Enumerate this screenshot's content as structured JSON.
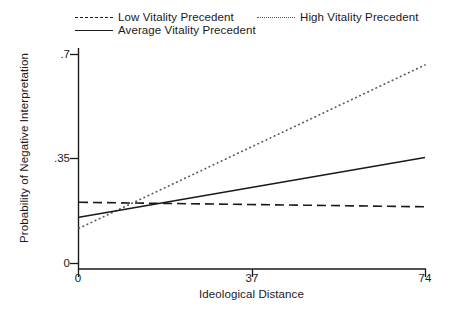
{
  "chart_data": {
    "type": "line",
    "title": "",
    "xlabel": "Ideological Distance",
    "ylabel": "Probability of Negative Interpretation",
    "xlim": [
      0,
      74
    ],
    "ylim": [
      0,
      0.7
    ],
    "xticks": [
      "0",
      "37",
      "74"
    ],
    "xtick_values": [
      0,
      37,
      74
    ],
    "yticks": [
      ".7",
      ".35",
      "0"
    ],
    "ytick_values": [
      0.7,
      0.35,
      0
    ],
    "grid": false,
    "legend_position": "top",
    "series": [
      {
        "name": "Low Vitality Precedent",
        "style": "dashed",
        "color": "#1a1a1a",
        "x": [
          0,
          74
        ],
        "values": [
          0.205,
          0.19
        ]
      },
      {
        "name": "Average Vitality Precedent",
        "style": "solid",
        "color": "#1a1a1a",
        "x": [
          0,
          74
        ],
        "values": [
          0.155,
          0.355
        ]
      },
      {
        "name": "High Vitality Precedent",
        "style": "dotted",
        "color": "#5a5a5a",
        "x": [
          0,
          74
        ],
        "values": [
          0.118,
          0.665
        ]
      }
    ],
    "annotations": []
  },
  "legend": {
    "low": "Low Vitality Precedent",
    "average": "Average Vitality Precedent",
    "high": "High Vitality Precedent"
  },
  "axes": {
    "x_title": "Ideological Distance",
    "y_title": "Probability of Negative Interpretation",
    "x_tick_0": "0",
    "x_tick_1": "37",
    "x_tick_2": "74",
    "y_tick_0": ".7",
    "y_tick_1": ".35",
    "y_tick_2": "0"
  },
  "colors": {
    "ink": "#1a1a1a",
    "dotted_ink": "#5a5a5a",
    "background": "#ffffff"
  }
}
